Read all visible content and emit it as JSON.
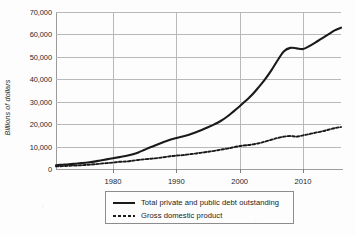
{
  "chart_data": {
    "type": "line",
    "title": "",
    "xlabel": "",
    "ylabel": "Billions of dollars",
    "xlim": [
      1971,
      2016
    ],
    "ylim": [
      0,
      70000
    ],
    "grid": true,
    "legend_position": "below-center",
    "y_ticks": [
      "0",
      "10,000",
      "20,000",
      "30,000",
      "40,000",
      "50,000",
      "60,000",
      "70,000"
    ],
    "y_tick_values": [
      0,
      10000,
      20000,
      30000,
      40000,
      50000,
      60000,
      70000
    ],
    "x_ticks": [
      "1980",
      "1990",
      "2000",
      "2010"
    ],
    "x_tick_values": [
      1980,
      1990,
      2000,
      2010
    ],
    "x": [
      1971,
      1972,
      1973,
      1974,
      1975,
      1976,
      1977,
      1978,
      1979,
      1980,
      1981,
      1982,
      1983,
      1984,
      1985,
      1986,
      1987,
      1988,
      1989,
      1990,
      1991,
      1992,
      1993,
      1994,
      1995,
      1996,
      1997,
      1998,
      1999,
      2000,
      2001,
      2002,
      2003,
      2004,
      2005,
      2006,
      2007,
      2008,
      2009,
      2010,
      2011,
      2012,
      2013,
      2014,
      2015,
      2016
    ],
    "series": [
      {
        "name": "Total private and public debt outstanding",
        "style": "solid",
        "color": "#1a1a1a",
        "values": [
          1700,
          1900,
          2100,
          2350,
          2600,
          2900,
          3300,
          3800,
          4300,
          4800,
          5300,
          5800,
          6500,
          7400,
          8600,
          9800,
          10900,
          12000,
          13000,
          13800,
          14500,
          15300,
          16300,
          17400,
          18600,
          19900,
          21400,
          23300,
          25600,
          28000,
          30500,
          33200,
          36500,
          40000,
          44000,
          48500,
          52500,
          54000,
          53800,
          53500,
          54800,
          56500,
          58200,
          60000,
          61800,
          63000
        ]
      },
      {
        "name": "Gross domestic product",
        "style": "dashed",
        "color": "#1a1a1a",
        "values": [
          1150,
          1280,
          1430,
          1550,
          1690,
          1880,
          2090,
          2360,
          2630,
          2860,
          3210,
          3340,
          3640,
          4040,
          4350,
          4590,
          4870,
          5250,
          5660,
          5980,
          6170,
          6540,
          6880,
          7310,
          7660,
          8100,
          8610,
          9090,
          9660,
          10250,
          10580,
          10940,
          11460,
          12210,
          13040,
          13820,
          14450,
          14710,
          14450,
          14990,
          15540,
          16200,
          16780,
          17520,
          18220,
          18700
        ]
      }
    ]
  },
  "legend": {
    "items": [
      {
        "label": "Total private and public debt outstanding",
        "swatch": "solid-line-swatch"
      },
      {
        "label": "Gross domestic product",
        "swatch": "dashed-line-swatch"
      }
    ]
  }
}
